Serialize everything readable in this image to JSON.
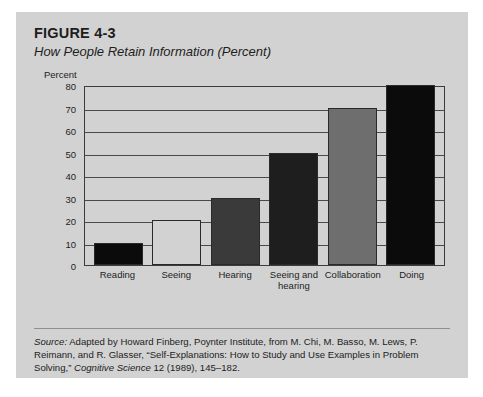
{
  "figure": {
    "number": "FIGURE 4-3",
    "title": "How People Retain Information (Percent)"
  },
  "source": {
    "label": "Source:",
    "line1_rest": " Adapted by Howard Finberg, Poynter Institute, from M. Chi, M. Basso, M. Lews,",
    "line2": "P. Reimann, and R. Glasser, “Self-Explanations: How to Study and Use Examples in Problem",
    "line3_pre": "Solving,” ",
    "journal": "Cognitive Science",
    "line3_post": " 12 (1989), 145–182."
  },
  "colors": {
    "card_background": "#d2d2d2",
    "axis": "#3c3c3c",
    "gridline": "#4a4a4a",
    "text": "#1d1d1d",
    "bar_black": "#0b0b0b",
    "bar_light": "#d2d2d2",
    "bar_dark_gray": "#3a3a3a",
    "bar_near_black": "#1e1e1e",
    "bar_mid_gray": "#6e6e6e"
  },
  "chart_data": {
    "type": "bar",
    "title": "How People Retain Information (Percent)",
    "xlabel": "",
    "ylabel": "Percent",
    "ylim": [
      0,
      80
    ],
    "yticks": [
      80,
      70,
      60,
      50,
      40,
      30,
      20,
      10,
      0
    ],
    "grid": true,
    "legend": "none",
    "categories": [
      "Reading",
      "Seeing",
      "Hearing",
      "Seeing and\nhearing",
      "Collaboration",
      "Doing"
    ],
    "category_lines": [
      [
        "Reading"
      ],
      [
        "Seeing"
      ],
      [
        "Hearing"
      ],
      [
        "Seeing and",
        "hearing"
      ],
      [
        "Collaboration"
      ],
      [
        "Doing"
      ]
    ],
    "values": [
      10,
      20,
      30,
      50,
      70,
      80
    ],
    "bar_colors": [
      "#0b0b0b",
      "#d2d2d2",
      "#3a3a3a",
      "#1e1e1e",
      "#6e6e6e",
      "#0b0b0b"
    ]
  }
}
